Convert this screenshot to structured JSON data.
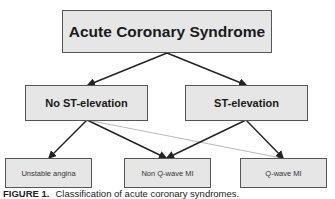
{
  "diagram": {
    "root": {
      "label": "Acute Coronary Syndrome"
    },
    "level2": [
      {
        "label": "No ST-elevation"
      },
      {
        "label": "ST-elevation"
      }
    ],
    "level3": [
      {
        "label": "Unstable angina"
      },
      {
        "label": "Non Q-wave MI"
      },
      {
        "label": "Q-wave MI"
      }
    ],
    "edges": [
      {
        "from": "Acute Coronary Syndrome",
        "to": "No ST-elevation",
        "style": "thick"
      },
      {
        "from": "Acute Coronary Syndrome",
        "to": "ST-elevation",
        "style": "thick"
      },
      {
        "from": "No ST-elevation",
        "to": "Unstable angina",
        "style": "thick"
      },
      {
        "from": "No ST-elevation",
        "to": "Non Q-wave MI",
        "style": "thick"
      },
      {
        "from": "No ST-elevation",
        "to": "Q-wave MI",
        "style": "thin"
      },
      {
        "from": "ST-elevation",
        "to": "Non Q-wave MI",
        "style": "thick"
      },
      {
        "from": "ST-elevation",
        "to": "Q-wave MI",
        "style": "thick"
      }
    ],
    "colors": {
      "box_fill": "#e6e6e6",
      "box_border": "#555555",
      "arrow": "#222222",
      "thin_arrow": "#999999"
    }
  },
  "caption": {
    "label": "FIGURE 1.",
    "text": "Classification of acute coronary syndromes."
  }
}
